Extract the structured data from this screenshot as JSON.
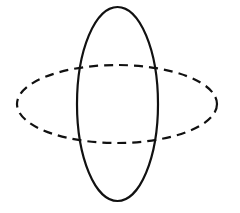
{
  "diagram": {
    "background": "#ffffff",
    "stroke_color": "#111111",
    "shapes": [
      {
        "id": "vertical-ellipse",
        "type": "ellipse",
        "style": "solid",
        "cx": 117.5,
        "cy": 104,
        "rx": 40.5,
        "ry": 97,
        "stroke_width": 2.2
      },
      {
        "id": "horizontal-ellipse",
        "type": "ellipse",
        "style": "dashed",
        "cx": 117,
        "cy": 104,
        "rx": 100,
        "ry": 39,
        "stroke_width": 2.2,
        "dash": "9 6"
      }
    ]
  }
}
